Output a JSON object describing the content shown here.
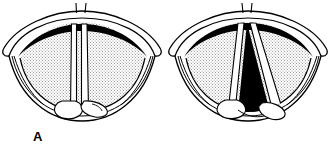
{
  "figure": {
    "background_color": "#ffffff",
    "ink_color": "#000000",
    "stipple_color": "#b4b4b4",
    "glottis_color": "#000000",
    "cord_color": "#ffffff"
  },
  "panels": [
    {
      "id": "A",
      "label": "A",
      "caption": "Vocal cords adducted (closed, phonation position)",
      "glottis_state": "closed",
      "anterior_commissure_ticks": 2,
      "arytenoid_count": 2,
      "cord_count": 2
    },
    {
      "id": "B",
      "label": "B",
      "caption": "Vocal cords abducted (open, respiration position)",
      "glottis_state": "open",
      "anterior_commissure_ticks": 2,
      "arytenoid_count": 2,
      "cord_count": 2
    }
  ],
  "structures": {
    "epiglottis": "epiglottis",
    "aryepiglottic_fold": "aryepiglottic-fold",
    "false_cord": "false-vocal-cord",
    "true_cord": "true-vocal-cord",
    "arytenoid": "arytenoid-cartilage",
    "glottic_opening": "glottic-opening",
    "pyriform_sinus": "pyriform-sinus",
    "anterior_commissure": "anterior-commissure"
  }
}
